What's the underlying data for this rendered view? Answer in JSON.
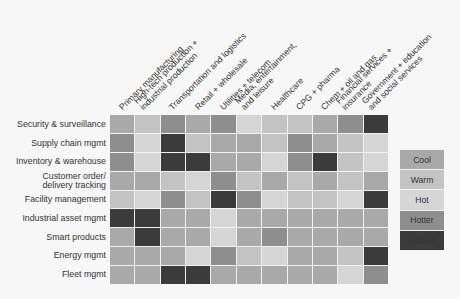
{
  "chart_data": {
    "type": "heatmap",
    "title": "",
    "columns": [
      "Primary manufacturing",
      "High-tech production + industrial production",
      "Transportation and logistics",
      "Retail + wholesale",
      "Utilities + telecom",
      "Media, entertainment, and leisure",
      "Healthcare",
      "CPG + pharma",
      "Chem + oil and gas",
      "Financial services + insurance",
      "Government + education and social services"
    ],
    "rows": [
      "Security & surveillance",
      "Supply chain mgmt",
      "Inventory & warehouse",
      "Customer order/ delivery tracking",
      "Facility management",
      "Industrial asset mgmt",
      "Smart products",
      "Energy mgmt",
      "Fleet mgmt"
    ],
    "scale": [
      "Cool",
      "Warm",
      "Hot",
      "Hotter",
      "Hottest"
    ],
    "values": [
      [
        0,
        1,
        3,
        0,
        3,
        2,
        1,
        1,
        0,
        3,
        4
      ],
      [
        3,
        2,
        4,
        1,
        0,
        0,
        1,
        3,
        0,
        1,
        2
      ],
      [
        3,
        2,
        4,
        4,
        0,
        0,
        2,
        3,
        4,
        1,
        2
      ],
      [
        0,
        0,
        1,
        2,
        3,
        1,
        0,
        1,
        0,
        1,
        0
      ],
      [
        1,
        2,
        3,
        1,
        4,
        3,
        2,
        1,
        1,
        2,
        4
      ],
      [
        4,
        4,
        0,
        0,
        2,
        0,
        0,
        0,
        0,
        0,
        0
      ],
      [
        0,
        4,
        0,
        0,
        2,
        0,
        3,
        0,
        0,
        0,
        0
      ],
      [
        0,
        0,
        0,
        2,
        3,
        1,
        2,
        0,
        0,
        1,
        4
      ],
      [
        0,
        0,
        4,
        4,
        0,
        0,
        0,
        0,
        0,
        2,
        3
      ]
    ],
    "legend_position": "right"
  },
  "column_labels": [
    [
      "Primary manufacturing"
    ],
    [
      "High-tech production +",
      "industrial production"
    ],
    [
      "Transportation and logistics"
    ],
    [
      "Retail + wholesale"
    ],
    [
      "Utilities + telecom"
    ],
    [
      "Media, entertainment,",
      "and leisure"
    ],
    [
      "Healthcare"
    ],
    [
      "CPG + pharma"
    ],
    [
      "Chem + oil and gas"
    ],
    [
      "Financial services +",
      "insurance"
    ],
    [
      "Government + education",
      "and social services"
    ]
  ],
  "row_labels": [
    [
      "Security & surveillance"
    ],
    [
      "Supply chain mgmt"
    ],
    [
      "Inventory & warehouse"
    ],
    [
      "Customer order/",
      "delivery tracking"
    ],
    [
      "Facility management"
    ],
    [
      "Industrial asset mgmt"
    ],
    [
      "Smart products"
    ],
    [
      "Energy mgmt"
    ],
    [
      "Fleet mgmt"
    ]
  ],
  "legend": [
    {
      "label": "Cool",
      "color": "#a9a9a9"
    },
    {
      "label": "Warm",
      "color": "#c3c3c3"
    },
    {
      "label": "Hot",
      "color": "#d5d5d5"
    },
    {
      "label": "Hotter",
      "color": "#8e8e8e"
    },
    {
      "label": "Hottest",
      "color": "#3b3b3b"
    }
  ]
}
